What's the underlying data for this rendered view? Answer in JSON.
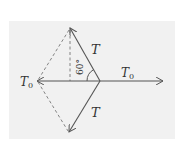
{
  "diagram": {
    "type": "force-vector-diagram",
    "background": "#f1f1f1",
    "stroke_color": "#555555",
    "labels": {
      "upper_tension": "T",
      "lower_tension": "T",
      "left_force_base": "T",
      "left_force_sub": "0",
      "right_force_base": "T",
      "right_force_sub": "0",
      "angle": "60°"
    },
    "vectors": [
      {
        "name": "upper-T",
        "from": [
          100,
          81
        ],
        "to": [
          70,
          28
        ]
      },
      {
        "name": "lower-T",
        "from": [
          100,
          81
        ],
        "to": [
          69,
          132
        ]
      },
      {
        "name": "left-T0",
        "from": [
          100,
          81
        ],
        "to": [
          37,
          81
        ]
      },
      {
        "name": "right-T0",
        "from": [
          100,
          81
        ],
        "to": [
          163,
          81
        ]
      }
    ],
    "dashed_lines": [
      {
        "from": [
          70,
          28
        ],
        "to": [
          70,
          81
        ]
      },
      {
        "from": [
          70,
          28
        ],
        "to": [
          37,
          81
        ]
      },
      {
        "from": [
          37,
          81
        ],
        "to": [
          69,
          132
        ]
      }
    ]
  }
}
